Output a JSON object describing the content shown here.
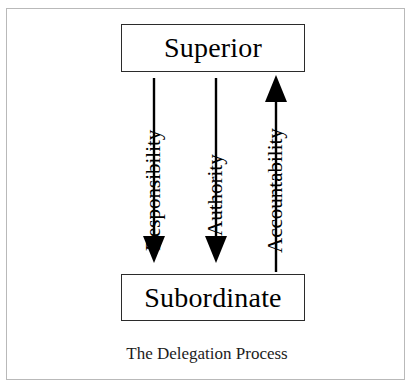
{
  "diagram": {
    "caption": "The Delegation Process",
    "background_color": "#ffffff",
    "frame_color": "#b9b9b9",
    "line_color": "#000000",
    "box_border_color": "#2b2b2b",
    "text_color": "#000000",
    "nodes": [
      {
        "id": "superior",
        "label": "Superior"
      },
      {
        "id": "subordinate",
        "label": "Subordinate"
      }
    ],
    "flows": [
      {
        "id": "responsibility",
        "label": "Responsibility",
        "from": "Superior",
        "to": "Subordinate",
        "direction": "down"
      },
      {
        "id": "authority",
        "label": "Authority",
        "from": "Superior",
        "to": "Subordinate",
        "direction": "down"
      },
      {
        "id": "accountability",
        "label": "Accountability",
        "from": "Subordinate",
        "to": "Superior",
        "direction": "up"
      }
    ]
  }
}
